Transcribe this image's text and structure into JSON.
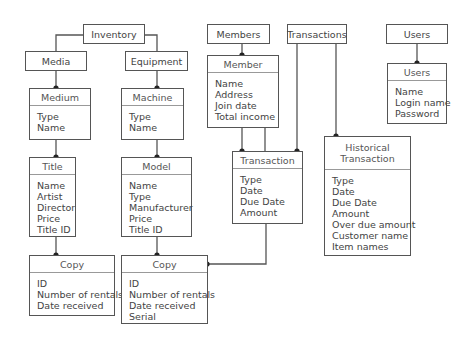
{
  "groups": {
    "inventory": "Inventory",
    "media": "Media",
    "equipment": "Equipment",
    "members": "Members",
    "transactions": "Transactions",
    "users": "Users"
  },
  "entities": {
    "medium": {
      "title": "Medium",
      "attrs": [
        "Type",
        "Name"
      ]
    },
    "machine": {
      "title": "Machine",
      "attrs": [
        "Type",
        "Name"
      ]
    },
    "title": {
      "title": "Title",
      "attrs": [
        "Name",
        "Artist",
        "Director",
        "Price",
        "Title ID"
      ]
    },
    "model": {
      "title": "Model",
      "attrs": [
        "Name",
        "Type",
        "Manufacturer",
        "Price",
        "Title ID"
      ]
    },
    "copy_media": {
      "title": "Copy",
      "attrs": [
        "ID",
        "Number of rentals",
        "Date received"
      ]
    },
    "copy_equipment": {
      "title": "Copy",
      "attrs": [
        "ID",
        "Number of rentals",
        "Date received",
        "Serial"
      ]
    },
    "member": {
      "title": "Member",
      "attrs": [
        "Name",
        "Address",
        "Join date",
        "Total income"
      ]
    },
    "transaction": {
      "title": "Transaction",
      "attrs": [
        "Type",
        "Date",
        "Due Date",
        "Amount"
      ]
    },
    "historical_transaction": {
      "title_line1": "Historical",
      "title_line2": "Transaction",
      "attrs": [
        "Type",
        "Date",
        "Due Date",
        "Amount",
        "Over due amount",
        "Customer name",
        "Item names"
      ]
    },
    "users": {
      "title": "Users",
      "attrs": [
        "Name",
        "Login name",
        "Password"
      ]
    }
  },
  "colors": {
    "line": "#555555",
    "text": "#444444"
  }
}
